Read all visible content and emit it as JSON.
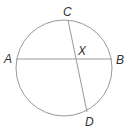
{
  "diagram": {
    "type": "circle-with-intersecting-chords",
    "circle": {
      "cx": 64,
      "cy": 68,
      "r": 48,
      "stroke": "#999999"
    },
    "chords": [
      {
        "name": "AB",
        "x1": 16,
        "y1": 59,
        "x2": 112,
        "y2": 59
      },
      {
        "name": "CD",
        "x1": 68,
        "y1": 20,
        "x2": 87,
        "y2": 112
      }
    ],
    "labels": {
      "A": "A",
      "B": "B",
      "C": "C",
      "D": "D",
      "X": "X"
    },
    "chord_color": "#999999",
    "label_color": "#333333"
  }
}
